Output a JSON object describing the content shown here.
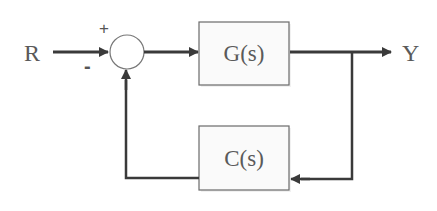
{
  "diagram": {
    "type": "feedback-control-block-diagram",
    "input_label": "R",
    "output_label": "Y",
    "summing_junction": {
      "plus_sign": "+",
      "minus_sign": "-"
    },
    "blocks": [
      {
        "id": "forward",
        "label": "G(s)"
      },
      {
        "id": "feedback",
        "label": "C(s)"
      }
    ],
    "colors": {
      "line": "#3a3a3a",
      "block_border": "#6a6a6a",
      "block_fill": "#fafafa",
      "text": "#5a5a5a",
      "background": "#ffffff"
    }
  }
}
